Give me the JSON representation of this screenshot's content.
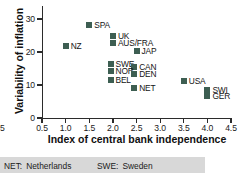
{
  "chart_data": {
    "type": "scatter",
    "title": "",
    "xlabel": "Index of central bank independence",
    "ylabel": "Variability of inflation",
    "xlim": [
      0.5,
      4.5
    ],
    "ylim": [
      0,
      33
    ],
    "xticks": [
      "0.5",
      "1.0",
      "1.5",
      "2.0",
      "2.5",
      "3.0",
      "3.5",
      "4.0",
      "4.5"
    ],
    "xtick_values": [
      0.5,
      1.0,
      1.5,
      2.0,
      2.5,
      3.0,
      3.5,
      4.0,
      4.5
    ],
    "yticks": [
      "0",
      "10",
      "20",
      "30"
    ],
    "ytick_values": [
      0,
      10,
      20,
      30
    ],
    "grid": false,
    "legend_position": "none",
    "marker_color": "#3d5e52",
    "points": [
      {
        "label": "NZ",
        "x": 1.0,
        "y": 21.8,
        "label_pos": "right"
      },
      {
        "label": "SPA",
        "x": 1.5,
        "y": 28.1,
        "label_pos": "right"
      },
      {
        "label": "UK",
        "x": 2.0,
        "y": 24.8,
        "label_pos": "right"
      },
      {
        "label": "AUS/FRA",
        "x": 2.0,
        "y": 22.7,
        "label_pos": "right"
      },
      {
        "label": "JAP",
        "x": 2.5,
        "y": 20.4,
        "label_pos": "right"
      },
      {
        "label": "SWE",
        "x": 1.95,
        "y": 16.3,
        "label_pos": "right"
      },
      {
        "label": "CAN",
        "x": 2.45,
        "y": 15.4,
        "label_pos": "right"
      },
      {
        "label": "NOR",
        "x": 1.95,
        "y": 14.2,
        "label_pos": "right"
      },
      {
        "label": "DEN",
        "x": 2.45,
        "y": 13.3,
        "label_pos": "right"
      },
      {
        "label": "BEL",
        "x": 1.95,
        "y": 11.4,
        "label_pos": "right"
      },
      {
        "label": "USA",
        "x": 3.5,
        "y": 11.2,
        "label_pos": "right"
      },
      {
        "label": "NET",
        "x": 2.45,
        "y": 9.2,
        "label_pos": "right"
      },
      {
        "label": "SWI",
        "x": 4.0,
        "y": 8.5,
        "label_pos": "right"
      },
      {
        "label": "GER",
        "x": 4.0,
        "y": 6.8,
        "label_pos": "right"
      }
    ]
  },
  "cutoff_tick_label": "5",
  "legend": {
    "entries": [
      {
        "key": "NET:",
        "name": "Netherlands"
      },
      {
        "key": "SWE:",
        "name": "Sweden"
      }
    ]
  }
}
